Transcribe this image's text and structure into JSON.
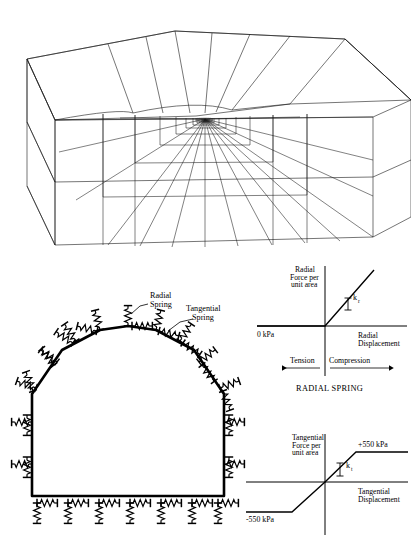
{
  "figure": {
    "panels": [
      {
        "name": "3d-mesh",
        "caption": ""
      },
      {
        "name": "tunnel-cross-section",
        "caption": ""
      },
      {
        "name": "radial-spring-graph",
        "caption": "RADIAL SPRING"
      },
      {
        "name": "tangential-spring-graph",
        "caption": ""
      }
    ]
  },
  "tunnel": {
    "labels": {
      "radial_spring": {
        "line1": "Radial",
        "line2": "Spring"
      },
      "tangential_spring": {
        "line1": "Tangential",
        "line2": "Spring"
      }
    }
  },
  "radial_chart": {
    "type": "line",
    "title": "RADIAL SPRING",
    "ylabel_lines": [
      "Radial",
      "Force per",
      "unit area"
    ],
    "xlabel_lines": [
      "Radial",
      "Displacement"
    ],
    "origin_label": "0 kPa",
    "slope_label": "k",
    "slope_sub": "r",
    "axis_left_label": "Tension",
    "axis_right_label": "Compression",
    "xlim": [
      -1,
      1
    ],
    "ylim": [
      -0.35,
      1
    ],
    "series": [
      {
        "name": "radial-force-displacement",
        "comment": "zero force in tension, linear stiffness k_r in compression",
        "x": [
          -1,
          0,
          0.78
        ],
        "y": [
          0,
          0,
          1.0
        ]
      }
    ],
    "grid": false,
    "legend": "none"
  },
  "tangential_chart": {
    "type": "line",
    "title": "",
    "ylabel_lines": [
      "Tangential",
      "Force per",
      "unit area"
    ],
    "xlabel_lines": [
      "Tangential",
      "Displacement"
    ],
    "yield_positive": "+550 kPa",
    "yield_negative": "-550 kPa",
    "slope_label": "k",
    "slope_sub": "t",
    "xlim": [
      -1,
      1
    ],
    "ylim": [
      -1,
      1
    ],
    "series": [
      {
        "name": "tangential-force-displacement",
        "comment": "elastic-perfectly-plastic, plateaus at +/-550 kPa",
        "x": [
          -1,
          -0.42,
          0,
          0.38,
          1
        ],
        "y": [
          -0.62,
          -0.62,
          0,
          0.62,
          0.62
        ]
      }
    ],
    "grid": false,
    "legend": "none"
  }
}
